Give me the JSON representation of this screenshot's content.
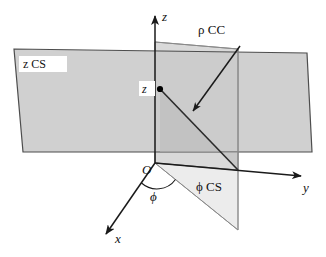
{
  "figure": {
    "background_color": "#ffffff"
  },
  "axes": [
    {
      "name": "z",
      "label": "z",
      "direction": "up",
      "from": [
        155,
        163
      ],
      "to": [
        155,
        14
      ],
      "arrow": true
    },
    {
      "name": "y",
      "label": "y",
      "direction": "right-down",
      "from": [
        155,
        163
      ],
      "to": [
        303,
        177
      ],
      "arrow": true
    },
    {
      "name": "x",
      "label": "x",
      "direction": "lower-left",
      "from": [
        155,
        163
      ],
      "to": [
        104,
        237
      ],
      "arrow": true
    }
  ],
  "origin": {
    "label": "O",
    "position": [
      155,
      163
    ]
  },
  "point": {
    "label": "z",
    "position": [
      160,
      89
    ],
    "marker": "dot"
  },
  "angle": {
    "label": "ϕ",
    "between": [
      "x-axis",
      "phi-cs-edge"
    ],
    "vertex": [
      155,
      163
    ]
  },
  "surfaces": [
    {
      "name": "z-constant-surface",
      "label": "z CS",
      "label_position": [
        24,
        66
      ],
      "kind": "horizontal-plane",
      "fill": "#c9c9c9",
      "stroke": "#4d4d4d",
      "points": "14,49 307,53 312,152 23,152"
    },
    {
      "name": "phi-constant-surface",
      "label": "ϕ CS",
      "label_position": [
        197,
        186
      ],
      "kind": "vertical-half-plane",
      "fill": "#ececec",
      "stroke": "#8a8a8a",
      "points": "155,163 238,170 238,230 155,163"
    },
    {
      "name": "rho-constant-surface",
      "label": "",
      "label_position": [
        0,
        0
      ],
      "kind": "vertical-plane",
      "fill": "#d5d5d5",
      "stroke": "#7a7a7a",
      "points": "155,42 238,49 238,170 155,163"
    }
  ],
  "coordinate_curve": {
    "name": "rho-coordinate-curve",
    "label": "ρ CC",
    "label_position": [
      199,
      30
    ],
    "from": [
      160,
      89
    ],
    "to": [
      238,
      170
    ],
    "arrow_from": [
      239,
      47
    ],
    "arrow_to": [
      191,
      113
    ]
  },
  "labels": {
    "z_axis": "z",
    "y_axis": "y",
    "x_axis": "x",
    "origin": "O",
    "point_z": "z",
    "phi_angle": "ϕ",
    "z_cs": "z CS",
    "phi_cs": "ϕ CS",
    "rho_cc": "ρ CC"
  },
  "colors": {
    "z_cs_fill": "#c9c9c9",
    "rho_cc_fill": "#d5d5d5",
    "phi_cs_fill": "#ececec",
    "line": "#1a1a1a",
    "edge": "#4d4d4d"
  }
}
